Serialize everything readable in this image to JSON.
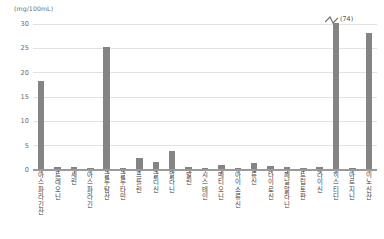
{
  "chart_data": {
    "type": "bar",
    "title": "",
    "subtitle": "",
    "xlabel": "",
    "ylabel": "",
    "unit_caption": "(mg/100mL)",
    "ylim": [
      0,
      30
    ],
    "yticks": [
      0,
      5,
      10,
      15,
      20,
      25,
      30
    ],
    "grid": true,
    "legend": "none",
    "bar_color": "#848484",
    "grid_color": "#e2e2e2",
    "axis_color": "#9a9a9a",
    "categories": [
      "아스파라긴산",
      "트레오닌",
      "세린",
      "아스파라긴",
      "글루탐산",
      "글루타민",
      "프롤린",
      "글리신",
      "알라닌",
      "발린",
      "시스테인",
      "메티오닌",
      "아이소류신",
      "류신",
      "타이로신",
      "페닐알라닌",
      "트립토판",
      "라이신",
      "히스티딘",
      "아르지닌",
      "이노신산"
    ],
    "values": [
      18.0,
      0.4,
      0.5,
      0.2,
      25.0,
      0.3,
      2.3,
      1.5,
      3.7,
      0.4,
      0.3,
      0.8,
      0.2,
      1.2,
      0.6,
      0.4,
      0.3,
      0.5,
      30.0,
      0.3,
      28.0
    ],
    "annotations": [
      {
        "category": "히스티딘",
        "label": "(74)",
        "actual_value": 74,
        "type": "axis-break",
        "note": "bar clipped at axis maximum with break mark"
      }
    ]
  }
}
